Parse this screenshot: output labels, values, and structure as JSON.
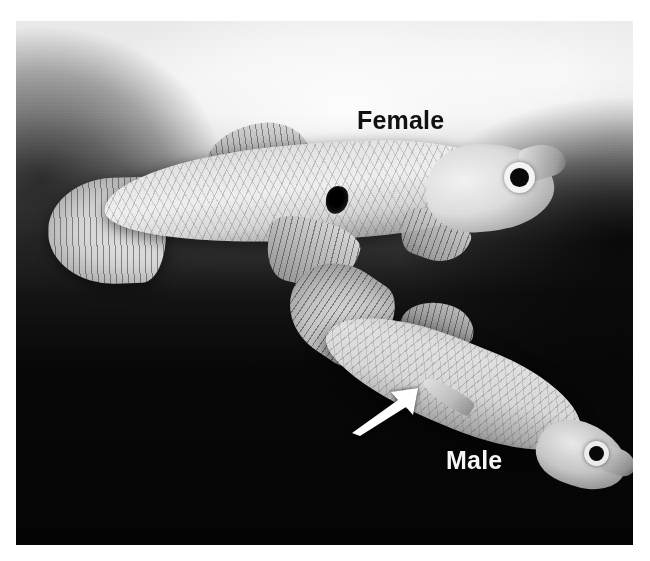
{
  "figure": {
    "kind": "photograph",
    "palette": "grayscale",
    "background_color": "#ffffff",
    "photo_dark_color": "#050505",
    "photo_light_color": "#ededed"
  },
  "labels": {
    "female": "Female",
    "male": "Male",
    "female_color": "#111111",
    "male_color": "#f6f6f6"
  },
  "annotations": {
    "arrow": {
      "icon": "arrow-up-right-icon",
      "color": "#ffffff",
      "points_to": "gonopodium"
    }
  },
  "specimens": [
    {
      "id": "female",
      "label": "Female",
      "position": "upper-left",
      "orientation": "head-right",
      "parts": [
        "caudal-fin",
        "dorsal-fin",
        "pelvic-fin",
        "pectoral-fin",
        "gravid-spot",
        "eye",
        "snout"
      ]
    },
    {
      "id": "male",
      "label": "Male",
      "position": "lower-right",
      "orientation": "head-lower-right",
      "parts": [
        "caudal-fin",
        "dorsal-fin",
        "gonopodium",
        "eye",
        "snout"
      ]
    }
  ]
}
